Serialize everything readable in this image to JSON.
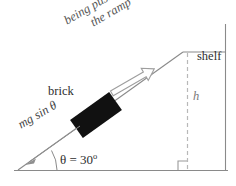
{
  "diagram": {
    "background_color": "#ffffff",
    "line_color": "#808080",
    "brick_color": "#111111",
    "dashed_color": "#b0b0b0",
    "text_color": "#3a3a3a",
    "labels": {
      "being_pushed_line1": "being pushed up",
      "being_pushed_line2": "the ramp",
      "brick": "brick",
      "force_mg_sin_theta": "mg sin θ",
      "angle": "θ = 30",
      "angle_degree_symbol": "o",
      "shelf": "shelf",
      "height": "h"
    },
    "geometry": {
      "angle_degrees": 30,
      "ground_y": 170,
      "ramp_base_x": 18,
      "apex_x": 183,
      "apex_y": 52,
      "wall_x": 225
    },
    "arrows": {
      "push_direction": "up-the-ramp",
      "push_style": "hollow-outline",
      "gravity_component_direction": "down-the-ramp",
      "gravity_component_style": "thin-line"
    }
  }
}
